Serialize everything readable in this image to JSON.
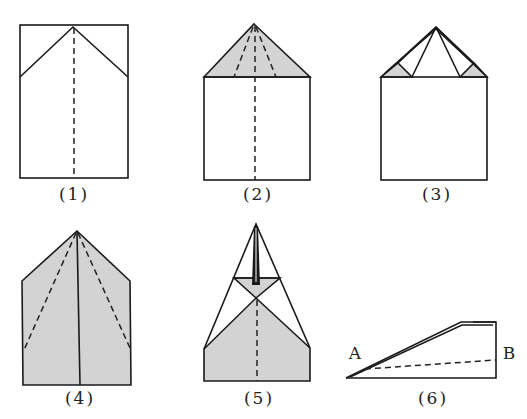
{
  "colors": {
    "paper": "#ffffff",
    "shaded": "#d3d3d3",
    "line": "#1a1a1a"
  },
  "steps": [
    {
      "id": 1,
      "caption": "(1)"
    },
    {
      "id": 2,
      "caption": "(2)"
    },
    {
      "id": 3,
      "caption": "(3)"
    },
    {
      "id": 4,
      "caption": "(4)"
    },
    {
      "id": 5,
      "caption": "(5)"
    },
    {
      "id": 6,
      "caption": "(6)"
    }
  ],
  "points": {
    "A": "A",
    "B": "B"
  }
}
